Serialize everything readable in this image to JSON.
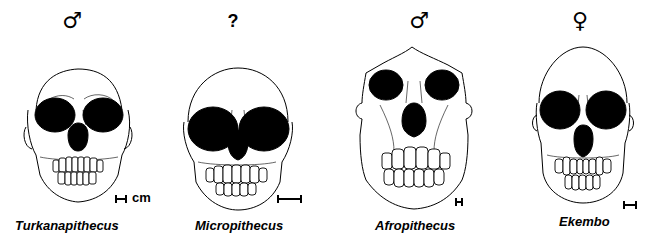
{
  "figure": {
    "specimens": [
      {
        "name": "Turkanapithecus",
        "sex_symbol": "♂",
        "sex": "male",
        "scale_label": "cm"
      },
      {
        "name": "Micropithecus",
        "sex_symbol": "?",
        "sex": "unknown",
        "scale_label": ""
      },
      {
        "name": "Afropithecus",
        "sex_symbol": "♂",
        "sex": "male",
        "scale_label": ""
      },
      {
        "name": "Ekembo",
        "sex_symbol": "♀",
        "sex": "female",
        "scale_label": ""
      }
    ]
  }
}
